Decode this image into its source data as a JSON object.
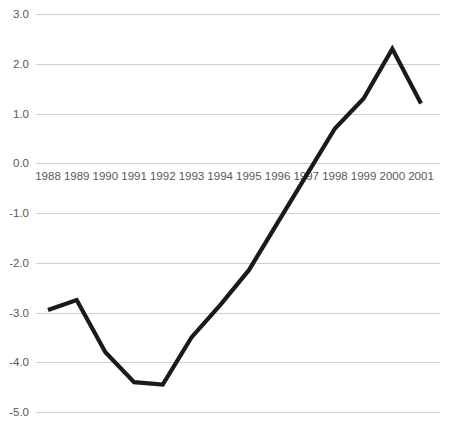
{
  "chart_data": {
    "type": "line",
    "title": "",
    "subtitle": "",
    "xlabel": "",
    "ylabel": "",
    "categories": [
      "1988",
      "1989",
      "1990",
      "1991",
      "1992",
      "1993",
      "1994",
      "1995",
      "1996",
      "1997",
      "1998",
      "1999",
      "2000",
      "2001"
    ],
    "values": [
      -2.95,
      -2.75,
      -3.8,
      -4.4,
      -4.45,
      -3.5,
      -2.85,
      -2.15,
      -1.2,
      -0.25,
      0.7,
      1.3,
      2.3,
      1.2
    ],
    "series": [
      {
        "name": "",
        "values": [
          -2.95,
          -2.75,
          -3.8,
          -4.4,
          -4.45,
          -3.5,
          -2.85,
          -2.15,
          -1.2,
          -0.25,
          0.7,
          1.3,
          2.3,
          1.2
        ]
      }
    ],
    "ylim": [
      -5.0,
      3.0
    ],
    "y_ticks": [
      3.0,
      2.0,
      1.0,
      0.0,
      -1.0,
      -2.0,
      -3.0,
      -4.0,
      -5.0
    ],
    "y_tick_labels": [
      "3.0",
      "2.0",
      "1.0",
      "0.0",
      "-1.0",
      "-2.0",
      "-3.0",
      "-4.0",
      "-5.0"
    ],
    "x_tick_labels": [
      "1988",
      "1989",
      "1990",
      "1991",
      "1992",
      "1993",
      "1994",
      "1995",
      "1996",
      "1997",
      "1998",
      "1999",
      "2000",
      "2001"
    ],
    "grid": true,
    "grid_axis": "y",
    "legend": false,
    "legend_position": "none",
    "line_color": "#1a1a1a",
    "grid_color": "#d0d0d0",
    "tick_label_color": "#58585a",
    "background_color": "#ffffff",
    "x_axis_label_row_value": 0.0,
    "annotations": []
  }
}
